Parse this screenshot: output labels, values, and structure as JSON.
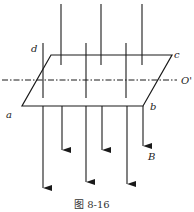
{
  "figure": {
    "caption": "图 8-16",
    "labels": {
      "a": "a",
      "b": "b",
      "c": "c",
      "d": "d",
      "axis": "O'",
      "field": "B"
    },
    "colors": {
      "line": "#1a1a1a",
      "background": "#ffffff"
    }
  }
}
